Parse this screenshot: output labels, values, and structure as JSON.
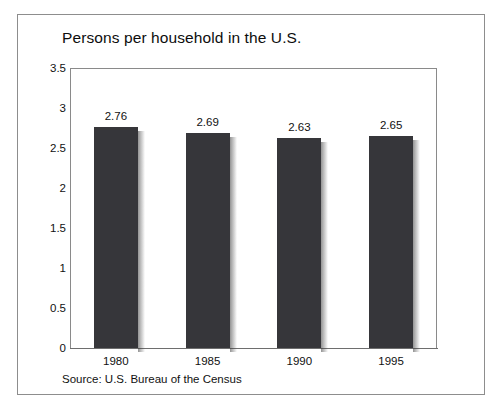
{
  "chart_data": {
    "type": "bar",
    "title": "Persons per household in the U.S.",
    "xlabel": "",
    "ylabel": "",
    "categories": [
      "1980",
      "1985",
      "1990",
      "1995"
    ],
    "values": [
      2.76,
      2.69,
      2.63,
      2.65
    ],
    "value_labels": [
      "2.76",
      "2.69",
      "2.63",
      "2.65"
    ],
    "ylim": [
      0,
      3.5
    ],
    "ytick_labels": [
      "0",
      "0.5",
      "1",
      "1.5",
      "2",
      "2.5",
      "3",
      "3.5"
    ],
    "ytick_values": [
      0,
      0.5,
      1,
      1.5,
      2,
      2.5,
      3,
      3.5
    ],
    "grid": false,
    "legend": false,
    "legend_position": "none",
    "bar_color": "#36363a",
    "axis_color": "#8a8a8a",
    "frame_color": "#8d8d8d",
    "text_color": "#111111",
    "source": "Source: U.S. Bureau of the Census"
  }
}
